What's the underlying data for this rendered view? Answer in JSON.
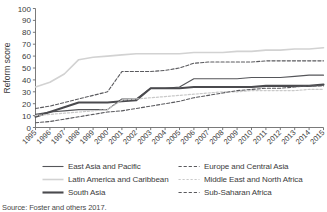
{
  "chart_data": {
    "type": "line",
    "title": "",
    "xlabel": "",
    "ylabel": "Reform score",
    "ylim": [
      0,
      100
    ],
    "ytick_step": 10,
    "yticks": [
      0,
      10,
      20,
      30,
      40,
      50,
      60,
      70,
      80,
      90,
      100
    ],
    "grid": false,
    "legend_position": "below",
    "x": [
      1995,
      1996,
      1997,
      1998,
      1999,
      2000,
      2001,
      2002,
      2003,
      2004,
      2005,
      2006,
      2007,
      2008,
      2009,
      2010,
      2011,
      2012,
      2013,
      2014,
      2015
    ],
    "categories": [
      "1995",
      "1996",
      "1997",
      "1998",
      "1999",
      "2000",
      "2001",
      "2002",
      "2003",
      "2004",
      "2005",
      "2006",
      "2007",
      "2008",
      "2009",
      "2010",
      "2011",
      "2012",
      "2013",
      "2014",
      "2015"
    ],
    "series": [
      {
        "name": "East Asia and Pacific",
        "style": "solid-thin",
        "color": "#55565a",
        "width": 1.1,
        "values": [
          11,
          13,
          14,
          15,
          15,
          15,
          24,
          24,
          33,
          33,
          34,
          41,
          41,
          41,
          41,
          42,
          42,
          42,
          43,
          44,
          44
        ]
      },
      {
        "name": "Latin America and Caribbean",
        "style": "solid-thin-light",
        "color": "#d2d2d2",
        "width": 1.6,
        "values": [
          34,
          38,
          45,
          57,
          59,
          60,
          61,
          62,
          62,
          62,
          62,
          63,
          63,
          63,
          64,
          64,
          65,
          65,
          66,
          66,
          67
        ]
      },
      {
        "name": "South Asia",
        "style": "solid-thick",
        "color": "#4a4a4e",
        "width": 2.1,
        "values": [
          9,
          13,
          17,
          21,
          21,
          21,
          22,
          23,
          33,
          33,
          33,
          34,
          34,
          34,
          34,
          34,
          35,
          35,
          35,
          35,
          36
        ]
      },
      {
        "name": "Europe and Central Asia",
        "style": "dashed",
        "color": "#5a5a5e",
        "width": 1.1,
        "values": [
          16,
          18,
          21,
          24,
          27,
          30,
          47,
          47,
          47,
          48,
          50,
          54,
          55,
          55,
          55,
          55,
          56,
          56,
          56,
          56,
          56
        ]
      },
      {
        "name": "Middle East and North Africa",
        "style": "dotted-light",
        "color": "#c9c9c9",
        "width": 1.2,
        "values": [
          10,
          11,
          12,
          13,
          14,
          15,
          23,
          24,
          25,
          26,
          27,
          28,
          29,
          30,
          30,
          31,
          31,
          31,
          31,
          32,
          32
        ]
      },
      {
        "name": "Sub-Saharan Africa",
        "style": "dashed",
        "color": "#5a5a5e",
        "width": 1.1,
        "values": [
          4,
          5,
          7,
          9,
          11,
          13,
          14,
          16,
          18,
          20,
          22,
          25,
          27,
          29,
          31,
          32,
          33,
          33,
          34,
          35,
          35
        ]
      }
    ]
  },
  "legend": {
    "items": [
      {
        "label": "East Asia and Pacific",
        "style": "solid-thin",
        "color": "#55565a"
      },
      {
        "label": "Europe and Central Asia",
        "style": "dashed",
        "color": "#5a5a5e"
      },
      {
        "label": "Latin America and Caribbean",
        "style": "solid-thin-light",
        "color": "#d2d2d2"
      },
      {
        "label": "Middle East and North Africa",
        "style": "dotted-light",
        "color": "#c9c9c9"
      },
      {
        "label": "South Asia",
        "style": "solid-thick",
        "color": "#4a4a4e"
      },
      {
        "label": "Sub-Saharan Africa",
        "style": "dashed",
        "color": "#5a5a5e"
      }
    ]
  },
  "source": {
    "text": "Source: Foster and others 2017."
  }
}
